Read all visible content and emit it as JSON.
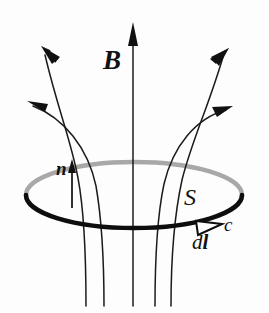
{
  "figure": {
    "kind": "physics-diagram",
    "background_color": "#fdfdfd",
    "ink_color": "#111111",
    "hidden_arc_color": "#a8a8a8",
    "width": 269,
    "height": 313
  },
  "labels": {
    "field": "B",
    "normal": "n",
    "surface": "S",
    "contour": "c",
    "line_element_d": "d",
    "line_element_l": "l"
  },
  "icons": {
    "field_arrow": "arrow-up-icon",
    "normal_arrow": "arrow-up-icon",
    "contour_arrow": "arrow-right-hollow-icon",
    "flux_arrow": "arrow-solid-icon"
  },
  "geometry": {
    "ellipse": {
      "cx": 134,
      "cy": 195,
      "rx": 108,
      "ry": 33,
      "front_stroke_width": 4.2,
      "back_stroke_width": 4.2
    },
    "center_axis": {
      "x": 133,
      "tip_y": 22,
      "bottom_y": 306
    },
    "normal_arrow": {
      "x": 72,
      "tip_y": 160,
      "bottom_y": 208
    },
    "contour_arrow_tip": {
      "x": 222,
      "y": 225
    },
    "flux_line_arrow_tips": [
      {
        "x": 41,
        "y": 46
      },
      {
        "x": 27,
        "y": 101
      },
      {
        "x": 229,
        "y": 48
      },
      {
        "x": 233,
        "y": 106
      }
    ],
    "lower_line_x_positions": [
      89,
      106,
      122,
      138,
      155
    ],
    "lower_line_bottom_y": 306
  }
}
